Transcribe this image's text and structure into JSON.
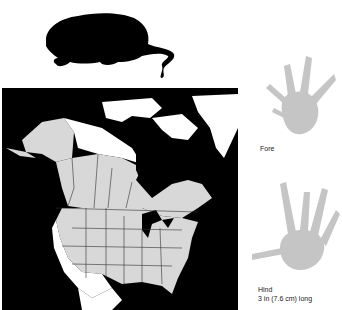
{
  "animal": {
    "silhouette_icon": "muskrat-silhouette"
  },
  "map": {
    "description": "North America range map",
    "colors": {
      "ocean": "#000000",
      "range": "#d8d8d8",
      "outside_range": "#ffffff",
      "borders": "#333333"
    }
  },
  "tracks": {
    "fore": {
      "label": "Fore"
    },
    "hind": {
      "label": "Hind",
      "size": "3 in (7.6 cm) long"
    }
  }
}
